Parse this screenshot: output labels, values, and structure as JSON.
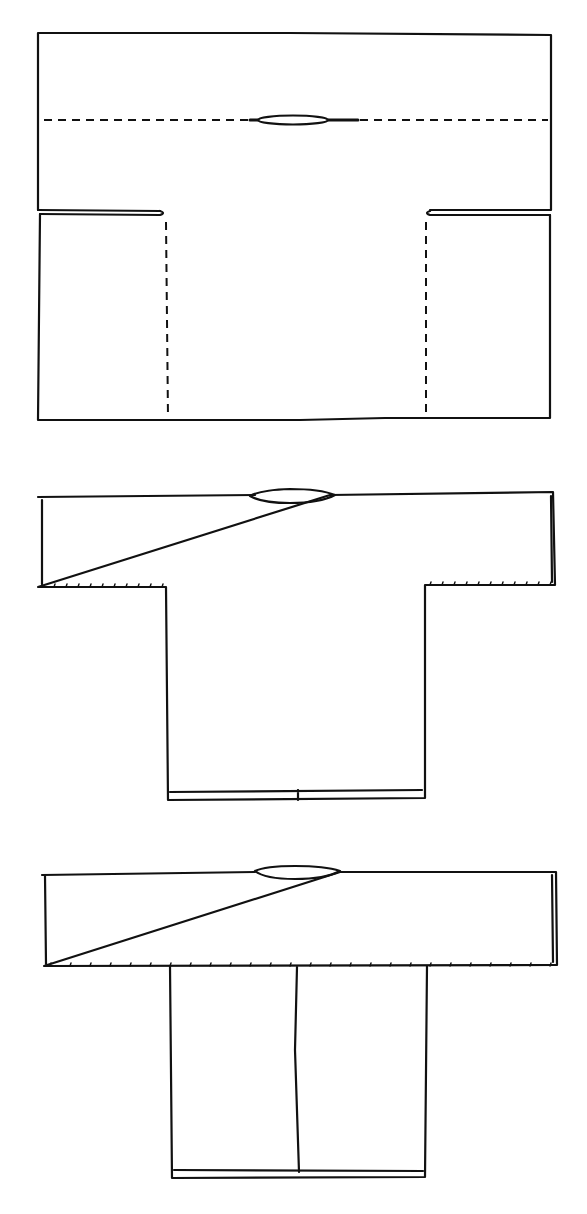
{
  "diagram": {
    "type": "garment-construction-steps",
    "colors": {
      "background": "#ffffff",
      "ink": "#111111"
    },
    "steps": [
      {
        "id": "step-1",
        "description": "Flat cut fabric piece with dashed shoulder fold line, neck slit, side slits and dashed vertical fold lines"
      },
      {
        "id": "step-2",
        "description": "Fabric folded at shoulders into T-shaped tunic, underarm seams stitched"
      },
      {
        "id": "step-3",
        "description": "Finished garment with sleeves and center-front seam"
      }
    ]
  }
}
